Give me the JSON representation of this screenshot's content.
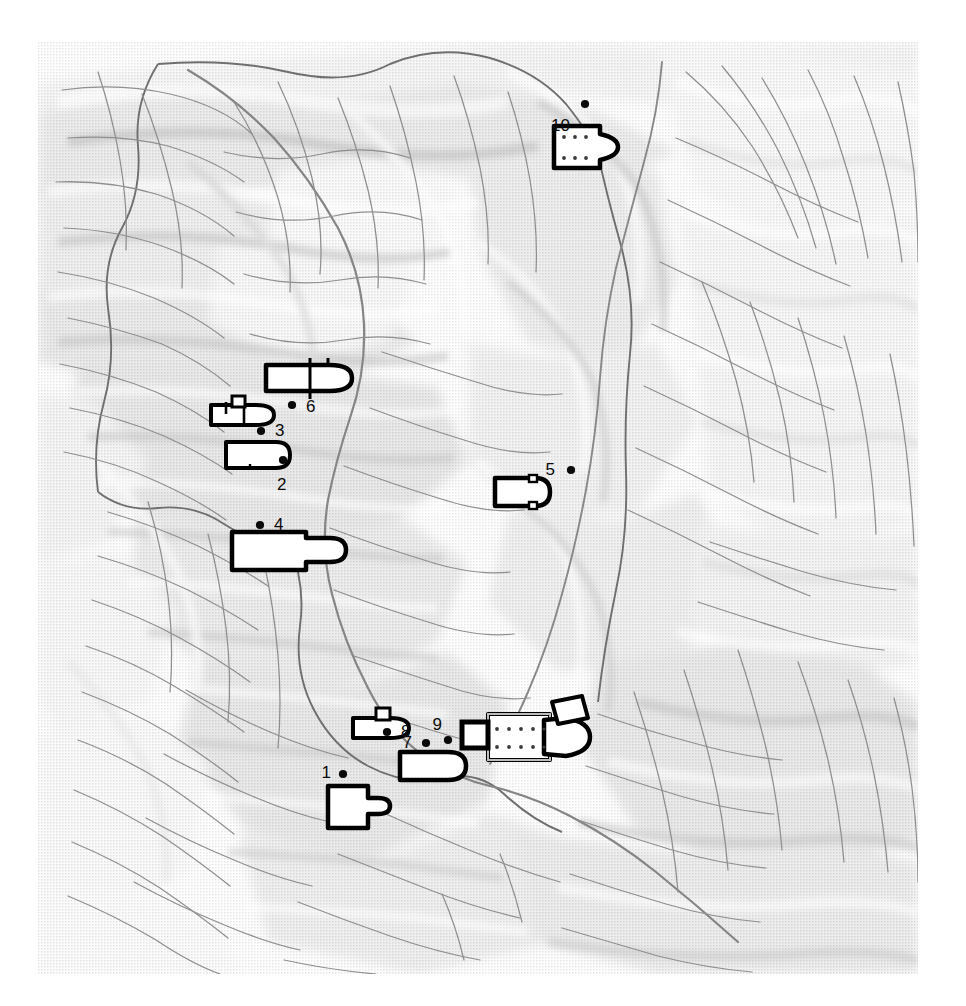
{
  "map": {
    "title": "Shaded relief map of an upland river basin with ten numbered archaeological church plans",
    "style": "halftone-dithered shaded relief, greyscale",
    "frame": {
      "left": 38,
      "top": 42,
      "width": 880,
      "height": 932
    },
    "background_color": "#fbfbfb",
    "colors": {
      "paper": "#ffffff",
      "relief_light": "#f2f2f2",
      "relief_mid": "#dedede",
      "relief_dark": "#c9c9c9",
      "relief_darkest": "#bdbdbd",
      "stream": "#8a8a8a",
      "watershed_boundary": "#6d6d6d",
      "ridge_line": "#9a9a9a",
      "plan_fill": "#ffffff",
      "plan_stroke": "#000000",
      "marker_dot": "#0a0a0a",
      "label_text": "#0a0a0a"
    },
    "legend_visible": false,
    "scale_bar_visible": false,
    "north_arrow_visible": false
  },
  "markers": [
    {
      "id": "1",
      "label": "1",
      "dot_x": 305,
      "dot_y": 732,
      "label_x": 293,
      "label_y": 730,
      "label_side": "left"
    },
    {
      "id": "2",
      "label": "2",
      "dot_x": 245,
      "dot_y": 418,
      "label_x": 239,
      "label_y": 442,
      "label_side": "below"
    },
    {
      "id": "3",
      "label": "3",
      "dot_x": 223,
      "dot_y": 389,
      "label_x": 237,
      "label_y": 388,
      "label_side": "right"
    },
    {
      "id": "4",
      "label": "4",
      "dot_x": 222,
      "dot_y": 483,
      "label_x": 236,
      "label_y": 482,
      "label_side": "right"
    },
    {
      "id": "5",
      "label": "5",
      "dot_x": 533,
      "dot_y": 428,
      "label_x": 517,
      "label_y": 427,
      "label_side": "left"
    },
    {
      "id": "6",
      "label": "6",
      "dot_x": 254,
      "dot_y": 363,
      "label_x": 268,
      "label_y": 364,
      "label_side": "right"
    },
    {
      "id": "7",
      "label": "7",
      "dot_x": 388,
      "dot_y": 701,
      "label_x": 374,
      "label_y": 700,
      "label_side": "left"
    },
    {
      "id": "8",
      "label": "8",
      "dot_x": 349,
      "dot_y": 690,
      "label_x": 363,
      "label_y": 689,
      "label_side": "right"
    },
    {
      "id": "9",
      "label": "9",
      "dot_x": 410,
      "dot_y": 698,
      "label_x": 404,
      "label_y": 682,
      "label_side": "above-left"
    },
    {
      "id": "10",
      "label": "10",
      "dot_x": 547,
      "dot_y": 62,
      "label_x": 532,
      "label_y": 83,
      "label_side": "below-left"
    }
  ],
  "church_plans": [
    {
      "ref": "1",
      "type": "single-nave-with-narthex",
      "x": 290,
      "y": 744,
      "w": 58,
      "h": 42
    },
    {
      "ref": "2",
      "type": "single-nave-apsed",
      "x": 188,
      "y": 400,
      "w": 78,
      "h": 26
    },
    {
      "ref": "3",
      "type": "nave-with-bell-tower",
      "x": 173,
      "y": 359,
      "w": 66,
      "h": 24
    },
    {
      "ref": "4",
      "type": "wide-nave-apsed",
      "x": 194,
      "y": 490,
      "w": 98,
      "h": 36
    },
    {
      "ref": "5",
      "type": "single-nave-apsed-small",
      "x": 457,
      "y": 436,
      "w": 54,
      "h": 28
    },
    {
      "ref": "6",
      "type": "cruciform-transept",
      "x": 228,
      "y": 323,
      "w": 86,
      "h": 26
    },
    {
      "ref": "7",
      "type": "single-nave-apsed",
      "x": 362,
      "y": 710,
      "w": 66,
      "h": 28
    },
    {
      "ref": "8",
      "type": "nave-with-bell-tower",
      "x": 315,
      "y": 666,
      "w": 56,
      "h": 30
    },
    {
      "ref": "9",
      "type": "basilica-with-baptistery",
      "x": 422,
      "y": 672,
      "w": 130,
      "h": 52
    },
    {
      "ref": "10",
      "type": "three-aisled-basilica",
      "x": 516,
      "y": 84,
      "w": 62,
      "h": 42
    }
  ],
  "chart_data": {
    "type": "map",
    "point_count": 10,
    "point_labels": [
      "1",
      "2",
      "3",
      "4",
      "5",
      "6",
      "7",
      "8",
      "9",
      "10"
    ]
  }
}
